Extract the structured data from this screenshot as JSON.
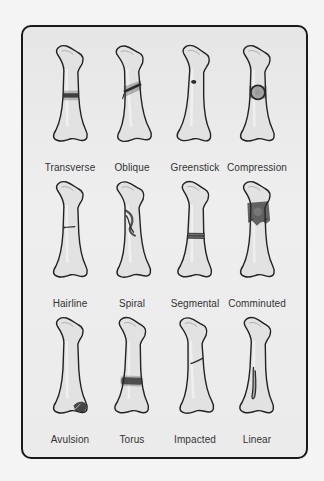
{
  "diagram": {
    "colors": {
      "frame_border": "#1a1a1a",
      "panel_bg": "#ebebeb",
      "bone_fill": "#e2e2e2",
      "bone_outline": "#222222",
      "fracture_mark": "#2a2a2a",
      "label_text": "#333333"
    },
    "rows": [
      {
        "fractures": [
          {
            "label": "Transverse",
            "type": "transverse"
          },
          {
            "label": "Oblique",
            "type": "oblique"
          },
          {
            "label": "Greenstick",
            "type": "greenstick"
          },
          {
            "label": "Compression",
            "type": "compression"
          }
        ]
      },
      {
        "fractures": [
          {
            "label": "Hairline",
            "type": "hairline"
          },
          {
            "label": "Spiral",
            "type": "spiral"
          },
          {
            "label": "Segmental",
            "type": "segmental"
          },
          {
            "label": "Comminuted",
            "type": "comminuted"
          }
        ]
      },
      {
        "fractures": [
          {
            "label": "Avulsion",
            "type": "avulsion"
          },
          {
            "label": "Torus",
            "type": "torus"
          },
          {
            "label": "Impacted",
            "type": "impacted"
          },
          {
            "label": "Linear",
            "type": "linear"
          }
        ]
      }
    ]
  }
}
